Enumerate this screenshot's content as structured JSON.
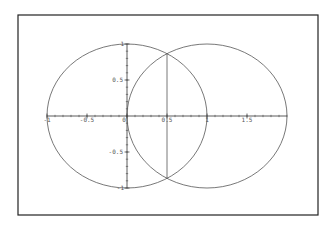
{
  "chart_data": {
    "type": "line",
    "title": "",
    "xlabel": "",
    "ylabel": "",
    "xlim": [
      -1.1,
      2.4
    ],
    "ylim": [
      -1.4,
      1.35
    ],
    "grid": false,
    "legend": null,
    "x_ticks": [
      -1,
      -0.5,
      0,
      0.5,
      1,
      1.5
    ],
    "x_tick_labels": [
      "-1",
      "-0.5",
      "0",
      "0.5",
      "1",
      "1.5"
    ],
    "y_ticks": [
      1,
      0.5,
      -0.5,
      -1
    ],
    "y_tick_labels": [
      "1",
      "0.5",
      "-0.5",
      "-1"
    ],
    "series": [
      {
        "name": "circle-1",
        "shape": "circle",
        "center": [
          0,
          0
        ],
        "radius": 1
      },
      {
        "name": "circle-2",
        "shape": "circle",
        "center": [
          1,
          0
        ],
        "radius": 1
      },
      {
        "name": "chord",
        "shape": "segment",
        "x": [
          0.5,
          0.5
        ],
        "y": [
          0.866,
          -0.866
        ]
      }
    ],
    "intersections": [
      [
        0.5,
        0.866
      ],
      [
        0.5,
        -0.866
      ]
    ]
  },
  "colors": {
    "curve": "#555555",
    "axis": "#333333",
    "frame": "#222222"
  }
}
